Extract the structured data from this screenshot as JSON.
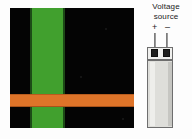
{
  "figure": {
    "background_color": "#fdfdfd"
  },
  "micrograph": {
    "name": "sample-micrograph",
    "background_color": "#040404",
    "layers": [
      {
        "name": "green-vertical-stripe",
        "color": "#41a02e",
        "orientation": "vertical"
      },
      {
        "name": "orange-horizontal-stripe",
        "color": "#de7429",
        "orientation": "horizontal"
      }
    ]
  },
  "voltage_source": {
    "label_line1": "Voltage",
    "label_line2": "source",
    "terminals": [
      {
        "name": "positive",
        "symbol": "+"
      },
      {
        "name": "negative",
        "symbol": "–"
      }
    ],
    "lead_color": "#9a9a9a",
    "contact_pad_color": "#1e1e1e",
    "body_color": "#dededa",
    "body_outline_color": "#6e6e6e"
  }
}
